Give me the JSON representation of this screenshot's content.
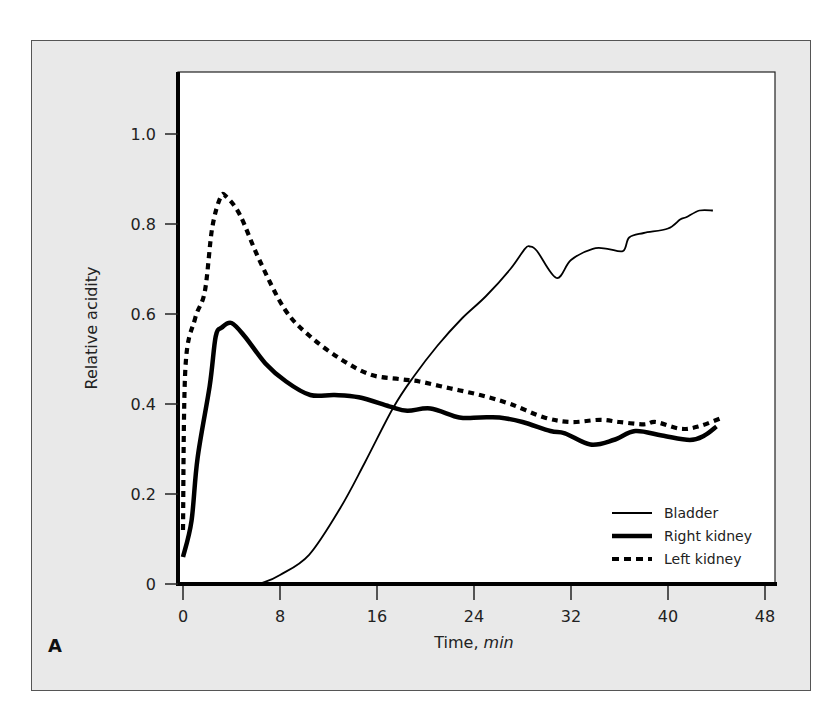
{
  "panel_label": "A",
  "chart_data": {
    "type": "line",
    "title": "",
    "xlabel": "Time,",
    "xlabel_unit": "min",
    "ylabel": "Relative acidity",
    "xlim": [
      -0.5,
      49
    ],
    "ylim": [
      0,
      1.1
    ],
    "xticks": [
      0,
      8,
      16,
      24,
      32,
      40,
      48
    ],
    "yticks": [
      0,
      0.2,
      0.4,
      0.6,
      0.8,
      1.0
    ],
    "ytick_labels": [
      "0",
      "0.2",
      "0.4",
      "0.6",
      "0.8",
      "1.0"
    ],
    "grid": false,
    "legend_position": "lower right",
    "series": [
      {
        "name": "Bladder",
        "style": "thin-solid",
        "x": [
          0,
          3,
          6,
          6.7,
          8,
          10.4,
          13,
          15,
          17.3,
          19,
          21,
          23,
          25,
          27,
          28.2,
          28.6,
          29.2,
          30.8,
          32,
          33.8,
          35,
          36.3,
          36.8,
          38,
          40,
          41,
          41.5,
          42.6,
          43.7
        ],
        "values": [
          0,
          0,
          0.002,
          0.004,
          0.02,
          0.065,
          0.17,
          0.27,
          0.39,
          0.46,
          0.53,
          0.59,
          0.64,
          0.7,
          0.745,
          0.75,
          0.74,
          0.68,
          0.72,
          0.745,
          0.745,
          0.74,
          0.77,
          0.78,
          0.79,
          0.81,
          0.815,
          0.83,
          0.83
        ]
      },
      {
        "name": "Right kidney",
        "style": "thick-solid",
        "x": [
          0,
          0.7,
          1.2,
          2.2,
          2.7,
          3.2,
          4,
          5.1,
          6.8,
          8.5,
          10.5,
          12.5,
          14.5,
          17,
          18.5,
          20.4,
          22.8,
          24.5,
          26.1,
          28,
          30.3,
          31.5,
          33.6,
          35.5,
          37.3,
          39.5,
          41.8,
          43,
          44
        ],
        "values": [
          0.06,
          0.14,
          0.28,
          0.44,
          0.55,
          0.57,
          0.58,
          0.55,
          0.49,
          0.45,
          0.42,
          0.42,
          0.415,
          0.395,
          0.385,
          0.39,
          0.37,
          0.37,
          0.37,
          0.36,
          0.34,
          0.335,
          0.31,
          0.32,
          0.34,
          0.33,
          0.32,
          0.33,
          0.35
        ]
      },
      {
        "name": "Left kidney",
        "style": "thick-dashed",
        "x": [
          0,
          0.2,
          1,
          1.8,
          2.4,
          3.1,
          3.6,
          4.7,
          6.3,
          8.4,
          10.5,
          13,
          15.5,
          18,
          19.5,
          22,
          24.5,
          27,
          29.8,
          32,
          34.4,
          36,
          38,
          39,
          41,
          42.5,
          44.5
        ],
        "values": [
          0.12,
          0.48,
          0.59,
          0.65,
          0.79,
          0.86,
          0.86,
          0.82,
          0.72,
          0.61,
          0.55,
          0.5,
          0.465,
          0.455,
          0.45,
          0.435,
          0.42,
          0.4,
          0.37,
          0.36,
          0.365,
          0.36,
          0.355,
          0.36,
          0.345,
          0.35,
          0.37
        ]
      }
    ]
  }
}
